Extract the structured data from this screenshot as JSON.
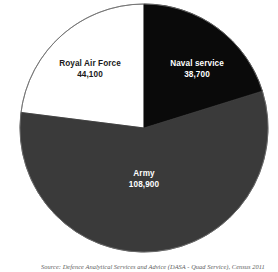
{
  "chart_data": {
    "type": "pie",
    "title": "",
    "subtitle": "",
    "xlabel": "",
    "ylabel": "",
    "grid": false,
    "legend_position": "none",
    "label_position": "inside-slice",
    "start_angle_deg": 0,
    "direction": "clockwise",
    "total": 191700,
    "categories": [
      "Naval service",
      "Army",
      "Royal Air Force"
    ],
    "values": [
      38700,
      108900,
      44100
    ],
    "value_labels": [
      "38,700",
      "108,900",
      "44,100"
    ],
    "slices": [
      {
        "name": "Naval service",
        "value": 38700,
        "value_label": "38,700",
        "percent": 20.2,
        "start_angle_deg": 0,
        "end_angle_deg": 72.7,
        "color": "#0a0a0a",
        "label_color": "#ffffff"
      },
      {
        "name": "Army",
        "value": 108900,
        "value_label": "108,900",
        "percent": 56.8,
        "start_angle_deg": 72.7,
        "end_angle_deg": 277.2,
        "color": "#3a3a3a",
        "label_color": "#ffffff"
      },
      {
        "name": "Royal Air Force",
        "value": 44100,
        "value_label": "44,100",
        "percent": 23.0,
        "start_angle_deg": 277.2,
        "end_angle_deg": 360,
        "color": "#ffffff",
        "label_color": "#1a1a1a"
      }
    ],
    "geometry": {
      "center_x": 144,
      "center_y": 128,
      "radius": 124,
      "stroke_color": "#6e6e6e",
      "stroke_width": 0.8
    }
  },
  "colors": {
    "naval": "#0a0a0a",
    "army": "#3a3a3a",
    "royal_air_force": "#ffffff",
    "outline": "#6e6e6e",
    "source_text": "#5c5c5c",
    "background": "#ffffff"
  },
  "labels": {
    "naval": {
      "name": "Naval service",
      "value": "38,700"
    },
    "army": {
      "name": "Army",
      "value": "108,900"
    },
    "raf": {
      "name": "Royal Air Force",
      "value": "44,100"
    }
  },
  "source": {
    "note": "Source: Defence Analytical Services and Advice (DASA - Quad Service), Census 2011"
  }
}
